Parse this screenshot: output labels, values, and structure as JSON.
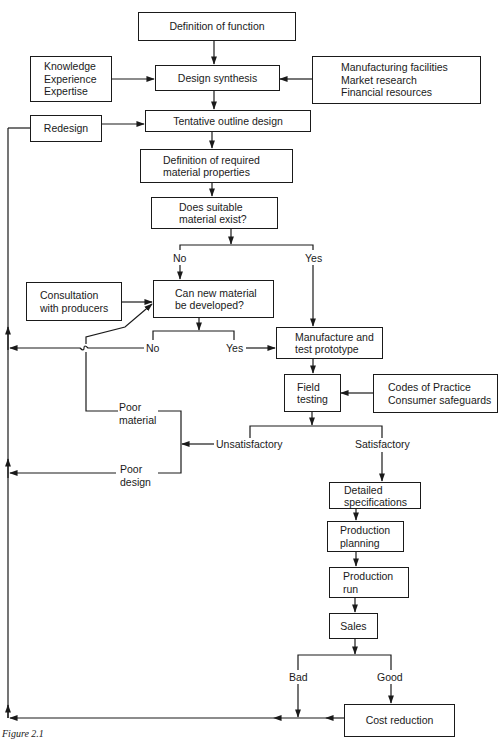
{
  "diagram": {
    "type": "flowchart",
    "caption": "Figure 2.1",
    "nodes": {
      "definition_of_function": {
        "lines": [
          "Definition of function"
        ]
      },
      "inputs_left": {
        "lines": [
          "Knowledge",
          "Experience",
          "Expertise"
        ]
      },
      "design_synthesis": {
        "lines": [
          "Design synthesis"
        ]
      },
      "inputs_right": {
        "lines": [
          "Manufacturing facilities",
          "Market research",
          "Financial resources"
        ]
      },
      "redesign": {
        "lines": [
          "Redesign"
        ]
      },
      "tentative_outline_design": {
        "lines": [
          "Tentative outline design"
        ]
      },
      "required_properties": {
        "lines": [
          "Definition of required",
          "material properties"
        ]
      },
      "material_exists": {
        "lines": [
          "Does suitable",
          "material exist?"
        ]
      },
      "consultation": {
        "lines": [
          "Consultation",
          "with producers"
        ]
      },
      "new_material": {
        "lines": [
          "Can new material",
          "be developed?"
        ]
      },
      "prototype": {
        "lines": [
          "Manufacture and",
          "test prototype"
        ]
      },
      "field_testing": {
        "lines": [
          "Field",
          "testing"
        ]
      },
      "codes": {
        "lines": [
          "Codes of Practice",
          "Consumer safeguards"
        ]
      },
      "detailed_specs": {
        "lines": [
          "Detailed",
          "specifications"
        ]
      },
      "production_planning": {
        "lines": [
          "Production",
          "planning"
        ]
      },
      "production_run": {
        "lines": [
          "Production",
          "run"
        ]
      },
      "sales": {
        "lines": [
          "Sales"
        ]
      },
      "cost_reduction": {
        "lines": [
          "Cost reduction"
        ]
      }
    },
    "edge_labels": {
      "exist_no": "No",
      "exist_yes": "Yes",
      "develop_no": "No",
      "develop_yes": "Yes",
      "poor_material": [
        "Poor",
        "material"
      ],
      "poor_design": [
        "Poor",
        "design"
      ],
      "unsatisfactory": "Unsatisfactory",
      "satisfactory": "Satisfactory",
      "sales_bad": "Bad",
      "sales_good": "Good"
    },
    "edges": [
      {
        "from": "Definition of function",
        "to": "Design synthesis"
      },
      {
        "from": "Knowledge / Experience / Expertise",
        "to": "Design synthesis"
      },
      {
        "from": "Manufacturing facilities / Market research / Financial resources",
        "to": "Design synthesis"
      },
      {
        "from": "Design synthesis",
        "to": "Tentative outline design"
      },
      {
        "from": "Redesign",
        "to": "Tentative outline design"
      },
      {
        "from": "Tentative outline design",
        "to": "Definition of required material properties"
      },
      {
        "from": "Definition of required material properties",
        "to": "Does suitable material exist?"
      },
      {
        "from": "Does suitable material exist?",
        "to": "Can new material be developed?",
        "label": "No"
      },
      {
        "from": "Does suitable material exist?",
        "to": "Manufacture and test prototype",
        "label": "Yes"
      },
      {
        "from": "Consultation with producers",
        "to": "Can new material be developed?"
      },
      {
        "from": "Can new material be developed?",
        "to": "Redesign (loop)",
        "label": "No"
      },
      {
        "from": "Can new material be developed?",
        "to": "Manufacture and test prototype",
        "label": "Yes"
      },
      {
        "from": "Manufacture and test prototype",
        "to": "Field testing"
      },
      {
        "from": "Codes of Practice / Consumer safeguards",
        "to": "Field testing"
      },
      {
        "from": "Field testing",
        "to": "Poor material / Poor design",
        "label": "Unsatisfactory"
      },
      {
        "from": "Poor material",
        "to": "Can new material be developed?"
      },
      {
        "from": "Poor design",
        "to": "Redesign (loop)"
      },
      {
        "from": "Field testing",
        "to": "Detailed specifications",
        "label": "Satisfactory"
      },
      {
        "from": "Detailed specifications",
        "to": "Production planning"
      },
      {
        "from": "Production planning",
        "to": "Production run"
      },
      {
        "from": "Production run",
        "to": "Sales"
      },
      {
        "from": "Sales",
        "to": "Redesign (loop)",
        "label": "Bad"
      },
      {
        "from": "Sales",
        "to": "Cost reduction",
        "label": "Good"
      },
      {
        "from": "Cost reduction",
        "to": "Redesign (loop)"
      }
    ]
  }
}
